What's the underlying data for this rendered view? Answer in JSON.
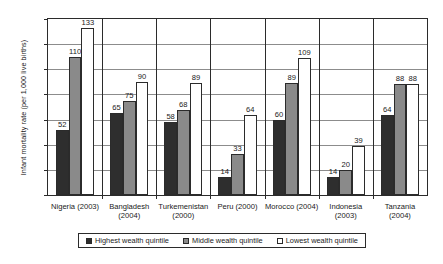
{
  "chart_data": {
    "type": "bar",
    "title": "",
    "xlabel": "",
    "ylabel": "Infant mortality rate (per 1,000 live births)",
    "ylim": [
      0,
      140
    ],
    "ytick_labels": [
      "140",
      "120",
      "100",
      "80",
      "60",
      "40",
      "20",
      "0"
    ],
    "ytick_values": [
      140,
      120,
      100,
      80,
      60,
      40,
      20,
      0
    ],
    "grid": true,
    "legend_position": "bottom",
    "categories": [
      "Nigeria (2003)",
      "Bangladesh\n(2004)",
      "Turkemenistan\n(2000)",
      "Peru (2000)",
      "Morocco (2004)",
      "Indonesia\n(2003)",
      "Tanzania (2004)"
    ],
    "series": [
      {
        "name": "Highest wealth quintile",
        "color": "#2e2e2e",
        "values": [
          52,
          65,
          58,
          14,
          60,
          14,
          64
        ]
      },
      {
        "name": "Middle wealth quintile",
        "color": "#8a8a8a",
        "values": [
          110,
          75,
          68,
          33,
          89,
          20,
          88
        ]
      },
      {
        "name": "Lowest wealth quintile",
        "color": "#ffffff",
        "values": [
          133,
          90,
          89,
          64,
          109,
          39,
          88
        ]
      }
    ]
  },
  "legend": {
    "items": [
      {
        "label": "Highest wealth quintile",
        "swatch": "highest"
      },
      {
        "label": "Middle wealth quintile",
        "swatch": "middle"
      },
      {
        "label": "Lowest wealth quintile",
        "swatch": "lowest"
      }
    ]
  }
}
